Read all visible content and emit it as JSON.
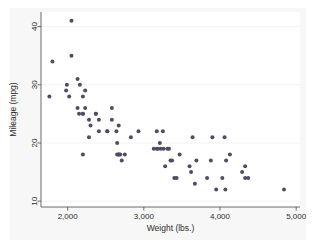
{
  "figure": {
    "type": "scatter-plot",
    "background_color": "#ffffff",
    "graph_region_color": "#f7f7f7",
    "plot_region_color": "#ffffff",
    "marker_color": "#4d4d63",
    "axis_color": "#5a5a5a",
    "grid_color": "#efefef"
  },
  "chart_data": {
    "type": "scatter",
    "title": "",
    "xlabel": "Weight (lbs.)",
    "ylabel": "Mileage (mpg)",
    "xlim": [
      1650,
      5050
    ],
    "ylim": [
      9,
      42.5
    ],
    "xticks": [
      2000,
      3000,
      4000,
      5000
    ],
    "xticklabels": [
      "2,000",
      "3,000",
      "4,000",
      "5,000"
    ],
    "yticks": [
      10,
      20,
      30,
      40
    ],
    "yticklabels": [
      "10",
      "20",
      "30",
      "40"
    ],
    "grid": "horizontal",
    "legend": null,
    "legend_position": "none",
    "marker_shape": "circle",
    "marker_size": 4,
    "series": [
      {
        "name": "auto",
        "x": [
          2930,
          3350,
          2640,
          3250,
          4080,
          3670,
          2230,
          3280,
          3880,
          3400,
          4330,
          3900,
          4290,
          4330,
          3370,
          4130,
          4370,
          4030,
          3620,
          4070,
          3950,
          3470,
          3210,
          3640,
          3830,
          2580,
          2200,
          2520,
          3330,
          2690,
          2130,
          2650,
          2200,
          2150,
          2670,
          2370,
          2020,
          2280,
          2750,
          3170,
          2280,
          3430,
          3260,
          3600,
          2050,
          2410,
          2200,
          2520,
          2300,
          2230,
          2370,
          2130,
          2650,
          1800,
          1990,
          3170,
          2710,
          2580,
          2200,
          2670,
          3310,
          3690,
          3180,
          3220,
          4060,
          3130,
          1760,
          2050,
          2410,
          2830,
          2160,
          1980,
          2670,
          4840
        ],
        "y": [
          22,
          17,
          22,
          22,
          17,
          13,
          29,
          16,
          17,
          14,
          14,
          21,
          15,
          16,
          17,
          18,
          14,
          14,
          15,
          12,
          12,
          18,
          20,
          21,
          14,
          24,
          18,
          22,
          19,
          18,
          26,
          18,
          25,
          25,
          18,
          25,
          28,
          21,
          18,
          19,
          24,
          14,
          19,
          16,
          35,
          22,
          28,
          22,
          23,
          26,
          25,
          31,
          20,
          34,
          30,
          22,
          17,
          26,
          25,
          18,
          19,
          17,
          19,
          19,
          21,
          19,
          28,
          41,
          24,
          21,
          30,
          29,
          23,
          12
        ]
      }
    ]
  },
  "axes": {
    "x_axis_label": "Weight (lbs.)",
    "y_axis_label": "Mileage (mpg)",
    "x_tick_labels": [
      "2,000",
      "3,000",
      "4,000",
      "5,000"
    ],
    "y_tick_labels": [
      "10",
      "20",
      "30",
      "40"
    ]
  }
}
